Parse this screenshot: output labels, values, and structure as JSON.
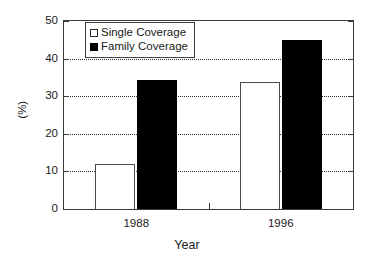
{
  "chart_data": {
    "type": "bar",
    "title": "",
    "xlabel": "Year",
    "ylabel": "(%)",
    "categories": [
      "1988",
      "1996"
    ],
    "series": [
      {
        "name": "Single Coverage",
        "values": [
          12,
          33.8
        ],
        "color": "#ffffff",
        "swatch": "open"
      },
      {
        "name": "Family Coverage",
        "values": [
          34.4,
          45
        ],
        "color": "#000000",
        "swatch": "filled"
      }
    ],
    "ylim": [
      0,
      50
    ],
    "yticks": [
      0,
      10,
      20,
      30,
      40,
      50
    ],
    "ytick_labels": [
      "0",
      "10",
      "20",
      "30",
      "40",
      "50"
    ],
    "gridlines": [
      10,
      20,
      30,
      40
    ],
    "grid": true,
    "legend_position": "upper left"
  },
  "legend": {
    "entries": [
      {
        "label": "Single Coverage"
      },
      {
        "label": "Family Coverage"
      }
    ]
  },
  "axes": {
    "x_title": "Year",
    "y_title": "(%)",
    "x_tick_labels": [
      "1988",
      "1996"
    ],
    "y_tick_labels": [
      "0",
      "10",
      "20",
      "30",
      "40",
      "50"
    ]
  }
}
